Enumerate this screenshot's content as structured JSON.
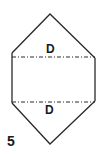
{
  "figure": {
    "number": "5",
    "fold_labels": [
      "D",
      "D"
    ],
    "colors": {
      "stroke": "#2a2a2a",
      "background": "#ffffff",
      "text": "#1a1a1a"
    }
  }
}
